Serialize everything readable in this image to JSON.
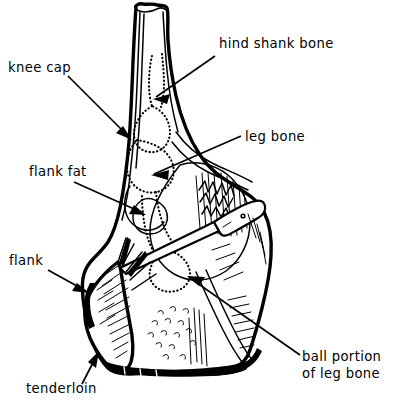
{
  "figure": {
    "background_color": "#ffffff",
    "ink_color": "#000000",
    "style": "black-and-white line drawing with leader arrows"
  },
  "labels": [
    {
      "id": "knee-cap",
      "text": "knee cap",
      "text_x": 8,
      "text_y": 72,
      "anchor": "start",
      "leader": {
        "x1": 68,
        "y1": 76,
        "x2": 128,
        "y2": 136
      },
      "arrow": {
        "x": 128,
        "y": 136,
        "angle_deg": 45
      }
    },
    {
      "id": "hind-shank-bone",
      "text": "hind shank bone",
      "text_x": 219,
      "text_y": 48,
      "anchor": "start",
      "leader": {
        "x1": 215,
        "y1": 56,
        "x2": 155,
        "y2": 97
      },
      "arrow": {
        "x": 155,
        "y": 97,
        "angle_deg": 214
      }
    },
    {
      "id": "leg-bone",
      "text": "leg bone",
      "text_x": 245,
      "text_y": 141,
      "anchor": "start",
      "leader": {
        "x1": 240,
        "y1": 137,
        "x2": 152,
        "y2": 175
      },
      "arrow": {
        "x": 152,
        "y": 175,
        "angle_deg": 203
      }
    },
    {
      "id": "flank-fat",
      "text": "flank fat",
      "text_x": 29,
      "text_y": 176,
      "anchor": "start",
      "leader": {
        "x1": 74,
        "y1": 182,
        "x2": 145,
        "y2": 214
      },
      "arrow": {
        "x": 145,
        "y": 214,
        "angle_deg": 24
      }
    },
    {
      "id": "flank",
      "text": "flank",
      "text_x": 9,
      "text_y": 265,
      "anchor": "start",
      "leader": {
        "x1": 48,
        "y1": 270,
        "x2": 88,
        "y2": 292
      },
      "arrow": {
        "x": 88,
        "y": 292,
        "angle_deg": 29
      }
    },
    {
      "id": "tenderloin",
      "text": "tenderloin",
      "text_x": 26,
      "text_y": 393,
      "anchor": "start",
      "leader": {
        "x1": 82,
        "y1": 383,
        "x2": 97,
        "y2": 353
      },
      "arrow": {
        "x": 97,
        "y": 353,
        "angle_deg": -63
      }
    },
    {
      "id": "ball-portion-of-leg-bone",
      "text": "ball portion",
      "text_line2": "of leg bone",
      "text_x": 302,
      "text_y": 361,
      "anchor": "start",
      "leader": {
        "x1": 300,
        "y1": 355,
        "x2": 188,
        "y2": 277
      },
      "arrow": {
        "x": 188,
        "y": 277,
        "angle_deg": 215
      }
    }
  ],
  "parts": {
    "shank": "hind shank bone",
    "patella": "knee cap",
    "femur": "leg bone",
    "femoral_head": "ball portion of leg bone",
    "flank_muscle": "flank",
    "flank_adipose": "flank fat",
    "psoas": "tenderloin"
  }
}
